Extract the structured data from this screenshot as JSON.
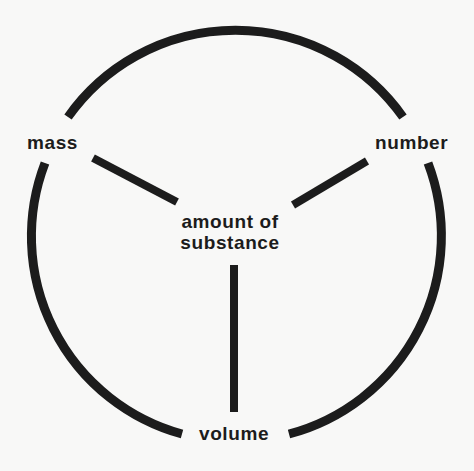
{
  "diagram": {
    "type": "concept-wheel",
    "center_label": {
      "line1": "amount of",
      "line2": "substance"
    },
    "nodes": [
      {
        "id": "mass",
        "label": "mass",
        "position": "upper-left"
      },
      {
        "id": "number",
        "label": "number",
        "position": "upper-right"
      },
      {
        "id": "volume",
        "label": "volume",
        "position": "bottom"
      }
    ],
    "edges": [
      {
        "from": "amount of substance",
        "to": "mass"
      },
      {
        "from": "amount of substance",
        "to": "number"
      },
      {
        "from": "amount of substance",
        "to": "volume"
      },
      {
        "from": "mass",
        "to": "number",
        "style": "outer-arc"
      },
      {
        "from": "mass",
        "to": "volume",
        "style": "outer-arc"
      },
      {
        "from": "number",
        "to": "volume",
        "style": "outer-arc"
      }
    ],
    "colors": {
      "stroke": "#1c1c1c",
      "background": "#f8f8f7"
    }
  }
}
